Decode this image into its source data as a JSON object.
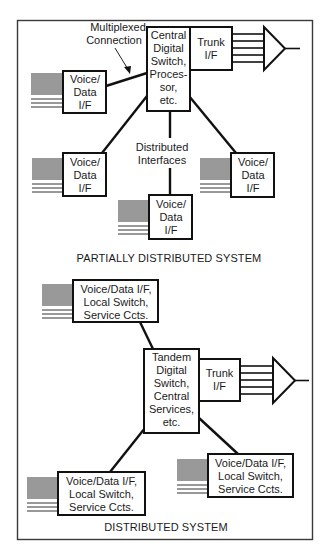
{
  "diagram": {
    "partial": {
      "title": "PARTIALLY DISTRIBUTED SYSTEM",
      "annotation": [
        "Multiplexed",
        "Connection"
      ],
      "central_switch": [
        "Central",
        "Digital",
        "Switch,",
        "Proces-",
        "sor,",
        "etc."
      ],
      "trunk": [
        "Trunk",
        "I/F"
      ],
      "distributed_label": [
        "Distributed",
        "Interfaces"
      ],
      "voice_data": [
        "Voice/",
        "Data",
        "I/F"
      ]
    },
    "distributed": {
      "title": "DISTRIBUTED SYSTEM",
      "tandem_switch": [
        "Tandem",
        "Digital",
        "Switch,",
        "Central",
        "Services,",
        "etc."
      ],
      "trunk": [
        "Trunk",
        "I/F"
      ],
      "local": [
        "Voice/Data I/F,",
        "Local Switch,",
        "Service Ccts."
      ]
    },
    "colors": {
      "line": "#111111",
      "frame": "#3a3a3a",
      "background": "#ffffff"
    }
  }
}
